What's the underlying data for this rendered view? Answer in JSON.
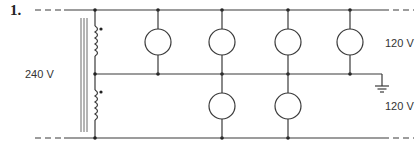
{
  "problem_number": "1.",
  "labels": {
    "primary_voltage": "240 V",
    "upper_secondary_voltage": "120 V",
    "lower_secondary_voltage": "120 V"
  },
  "diagram": {
    "type": "three-wire single-phase transformer circuit",
    "rails": [
      "top line",
      "neutral (grounded)",
      "bottom line"
    ],
    "upper_lamps": 4,
    "lower_lamps": 2,
    "ground_on": "neutral"
  }
}
